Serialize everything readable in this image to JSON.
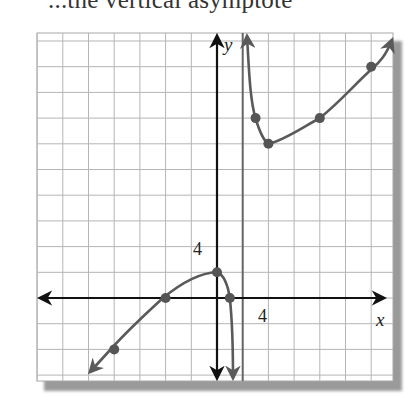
{
  "header": {
    "partial_text": "...the vertical asymptote"
  },
  "chart_data": {
    "type": "line",
    "title": "",
    "xlabel": "x",
    "ylabel": "y",
    "tick_labels": {
      "x": "4",
      "y": "4"
    },
    "grid": true,
    "grid_step": 2,
    "xlim": [
      -14,
      14
    ],
    "ylim": [
      -6.5,
      20.5
    ],
    "vertical_asymptote": {
      "x": 2,
      "style": "solid gray line"
    },
    "series": [
      {
        "name": "left branch",
        "points": [
          [
            -8,
            -4
          ],
          [
            -4,
            0
          ],
          [
            0,
            2
          ],
          [
            1,
            0
          ]
        ],
        "behavior": "arrow down-left as x→-∞; goes to -∞ as x→2⁻"
      },
      {
        "name": "right branch",
        "points": [
          [
            3,
            14
          ],
          [
            4,
            12
          ],
          [
            8,
            14
          ],
          [
            12,
            18
          ]
        ],
        "behavior": "goes to +∞ as x→2⁺; arrow up-right as x→+∞"
      }
    ],
    "colors": {
      "curve": "#5a5a5a",
      "axes": "#111111",
      "grid": "#b8b8b8",
      "asymptote": "#666666"
    }
  }
}
